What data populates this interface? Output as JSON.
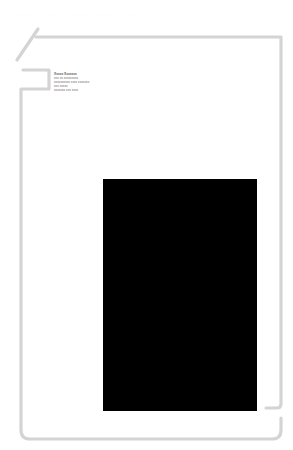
{
  "header": {
    "faint_text": "· · ·  · · · · ·   · · · · · · · · · · · · · ·   · · · · · · · · · ·        · · · · · · · · · ·         · · · · · · ·   · · · · · ·"
  },
  "contact_block": {
    "_note": "placeholder text: the original lines are illegible in the screenshot",
    "name": "Xxxxx Xxxxxxx",
    "lines": [
      "xxx xx xxxxxxxxx",
      "xxxxxxxxxx xxxx xxxxxxx",
      "xxx xxxxx",
      "xxxxxxx xxx xxxx"
    ]
  },
  "photo": {
    "fill_color": "#000000"
  },
  "frame": {
    "stroke_color": "#d4d4d4"
  }
}
